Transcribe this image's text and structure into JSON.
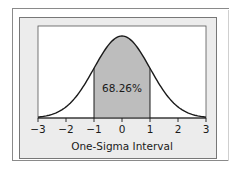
{
  "chart_data": {
    "type": "area",
    "title": "",
    "xlabel": "One-Sigma Interval",
    "ylabel": "",
    "distribution": "standard normal",
    "x_ticks": [
      -3,
      -2,
      -1,
      0,
      1,
      2,
      3
    ],
    "x_tick_labels": [
      "−3",
      "−2",
      "−1",
      "0",
      "1",
      "2",
      "3"
    ],
    "xlim": [
      -3,
      3
    ],
    "shaded_region": {
      "from": -1,
      "to": 1,
      "label": "68.26%",
      "percent": 68.26
    },
    "grid": false,
    "legend": null,
    "colors": {
      "curve": "#1a1a1a",
      "shaded_fill": "#bdbdbd",
      "plot_background": "#ffffff",
      "panel_background": "#ececec",
      "axis": "#1a1a1a"
    }
  }
}
